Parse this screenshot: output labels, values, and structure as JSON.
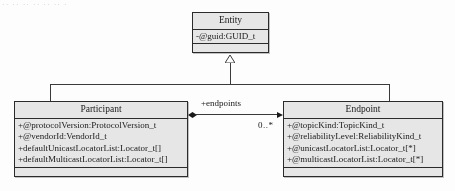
{
  "diagram": {
    "type": "uml-class-diagram",
    "artifact_text": "·· ·· ·· ·· ·· ·· ·· ··",
    "classes": [
      {
        "id": "entity",
        "name": "Entity",
        "attributes": [
          "-@guid:GUID_t"
        ],
        "operations": []
      },
      {
        "id": "participant",
        "name": "Participant",
        "attributes": [
          "+@protocolVersion:ProtocolVersion_t",
          "+@vendorId:VendorId_t",
          "+defaultUnicastLocatorList:Locator_t[]",
          "+defaultMulticastLocatorList:Locator_t[]"
        ],
        "operations": []
      },
      {
        "id": "endpoint",
        "name": "Endpoint",
        "attributes": [
          "+@topicKind:TopicKind_t",
          "+@reliabilityLevel:ReliabilityKind_t",
          "+@unicastLocatorList:Locator_t[*]",
          "+@multicastLocatorList:Locator_t[*]"
        ],
        "operations": []
      }
    ],
    "relationships": [
      {
        "id": "gen-participant-entity",
        "kind": "generalization",
        "from": "Participant",
        "to": "Entity"
      },
      {
        "id": "gen-endpoint-entity",
        "kind": "generalization",
        "from": "Endpoint",
        "to": "Entity"
      },
      {
        "id": "assoc-participant-endpoint",
        "kind": "composition",
        "from": "Participant",
        "to": "Endpoint",
        "role_label": "+endpoints",
        "target_multiplicity": "0..*"
      }
    ],
    "colors": {
      "box_fill": "#e6e6e6",
      "box_border": "#2b2b2b",
      "line": "#3a3a3a",
      "text": "#1a1a1a",
      "background": "#fdfdfd"
    }
  }
}
